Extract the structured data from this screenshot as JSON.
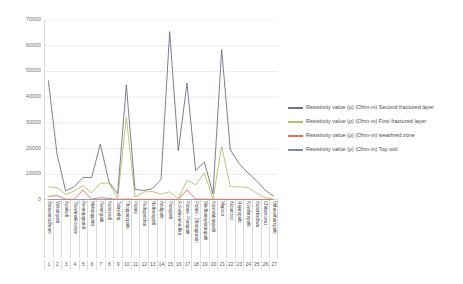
{
  "chart_data": {
    "type": "line",
    "title": "",
    "xlabel": "",
    "ylabel": "",
    "ylim": [
      0,
      70000
    ],
    "yticks": [
      0,
      10000,
      20000,
      30000,
      40000,
      50000,
      60000,
      70000
    ],
    "grid": true,
    "legend_position": "right",
    "x_indices": [
      1,
      2,
      3,
      4,
      5,
      6,
      7,
      8,
      9,
      10,
      11,
      12,
      13,
      14,
      15,
      16,
      17,
      18,
      19,
      20,
      21,
      22,
      23,
      24,
      25,
      26,
      27
    ],
    "categories": [
      "Balasamudhram",
      "Vellampatti",
      "Ayakudi",
      "Tiruvanaikoorum",
      "Amarajapundi",
      "Mettuappatti",
      "Pulampatti",
      "Kummadi",
      "Talayuthu",
      "Thoppampatti",
      "Palani",
      "Pudupatchur",
      "Neikarapatti",
      "Andipatti",
      "Parapatti",
      "A.Kalaiyamudhur",
      "Palani- Parapatti",
      "Palani - Dharapuram",
      "Mudhanayakanpatti",
      "Kamalakanpatti",
      "Mapoor",
      "Kizamoor",
      "Rajampatti",
      "Kowilampatti",
      "Kurukkadavu",
      "Chitamcevu",
      "Vithreethampatti"
    ],
    "series": [
      {
        "name": "Resistivity value (ρ) (Ohm-m) Second fractured layer",
        "color": "#7a6a86",
        "values": [
          46500,
          17900,
          3500,
          5200,
          8800,
          8700,
          21800,
          6900,
          2500,
          44800,
          4100,
          3700,
          4400,
          8000,
          65500,
          19100,
          45500,
          11400,
          14800,
          2400,
          58500,
          19500,
          14200,
          10600,
          7600,
          3900,
          1400
        ]
      },
      {
        "name": "Resistivity value (ρ) (Ohm-m) First fractured layer",
        "color": "#b6bd6b",
        "values": [
          5100,
          4800,
          2200,
          3500,
          5600,
          2800,
          6500,
          6600,
          500,
          32200,
          1200,
          3100,
          3300,
          2200,
          3200,
          400,
          7700,
          5900,
          10500,
          400,
          20900,
          5200,
          5100,
          4900,
          2800,
          900,
          300
        ]
      },
      {
        "name": "Resistivity value (ρ) (Ohm-m) weathred zone",
        "color": "#e8705a",
        "values": [
          1400,
          1700,
          300,
          300,
          3900,
          350,
          900,
          600,
          200,
          400,
          250,
          250,
          250,
          250,
          250,
          250,
          3900,
          350,
          350,
          250,
          300,
          250,
          250,
          250,
          250,
          200,
          150
        ]
      },
      {
        "name": "Resistivity value (ρ) (Ohm-m) Top soil",
        "color": "#7b8bb0",
        "values": [
          150,
          150,
          120,
          120,
          150,
          120,
          120,
          120,
          100,
          120,
          100,
          100,
          100,
          100,
          100,
          100,
          120,
          100,
          100,
          100,
          100,
          100,
          100,
          100,
          100,
          90,
          80
        ]
      }
    ]
  },
  "legend": {
    "entries": [
      {
        "label": "Resistivity value (ρ) (Ohm-m) Second fractured layer",
        "color": "#7a6a86"
      },
      {
        "label": "Resistivity value (ρ) (Ohm-m) First fractured layer",
        "color": "#b6bd6b"
      },
      {
        "label": "Resistivity value (ρ) (Ohm-m) weathred zone",
        "color": "#e8705a"
      },
      {
        "label": "Resistivity value (ρ) (Ohm-m) Top soil",
        "color": "#7b8bb0"
      }
    ]
  }
}
